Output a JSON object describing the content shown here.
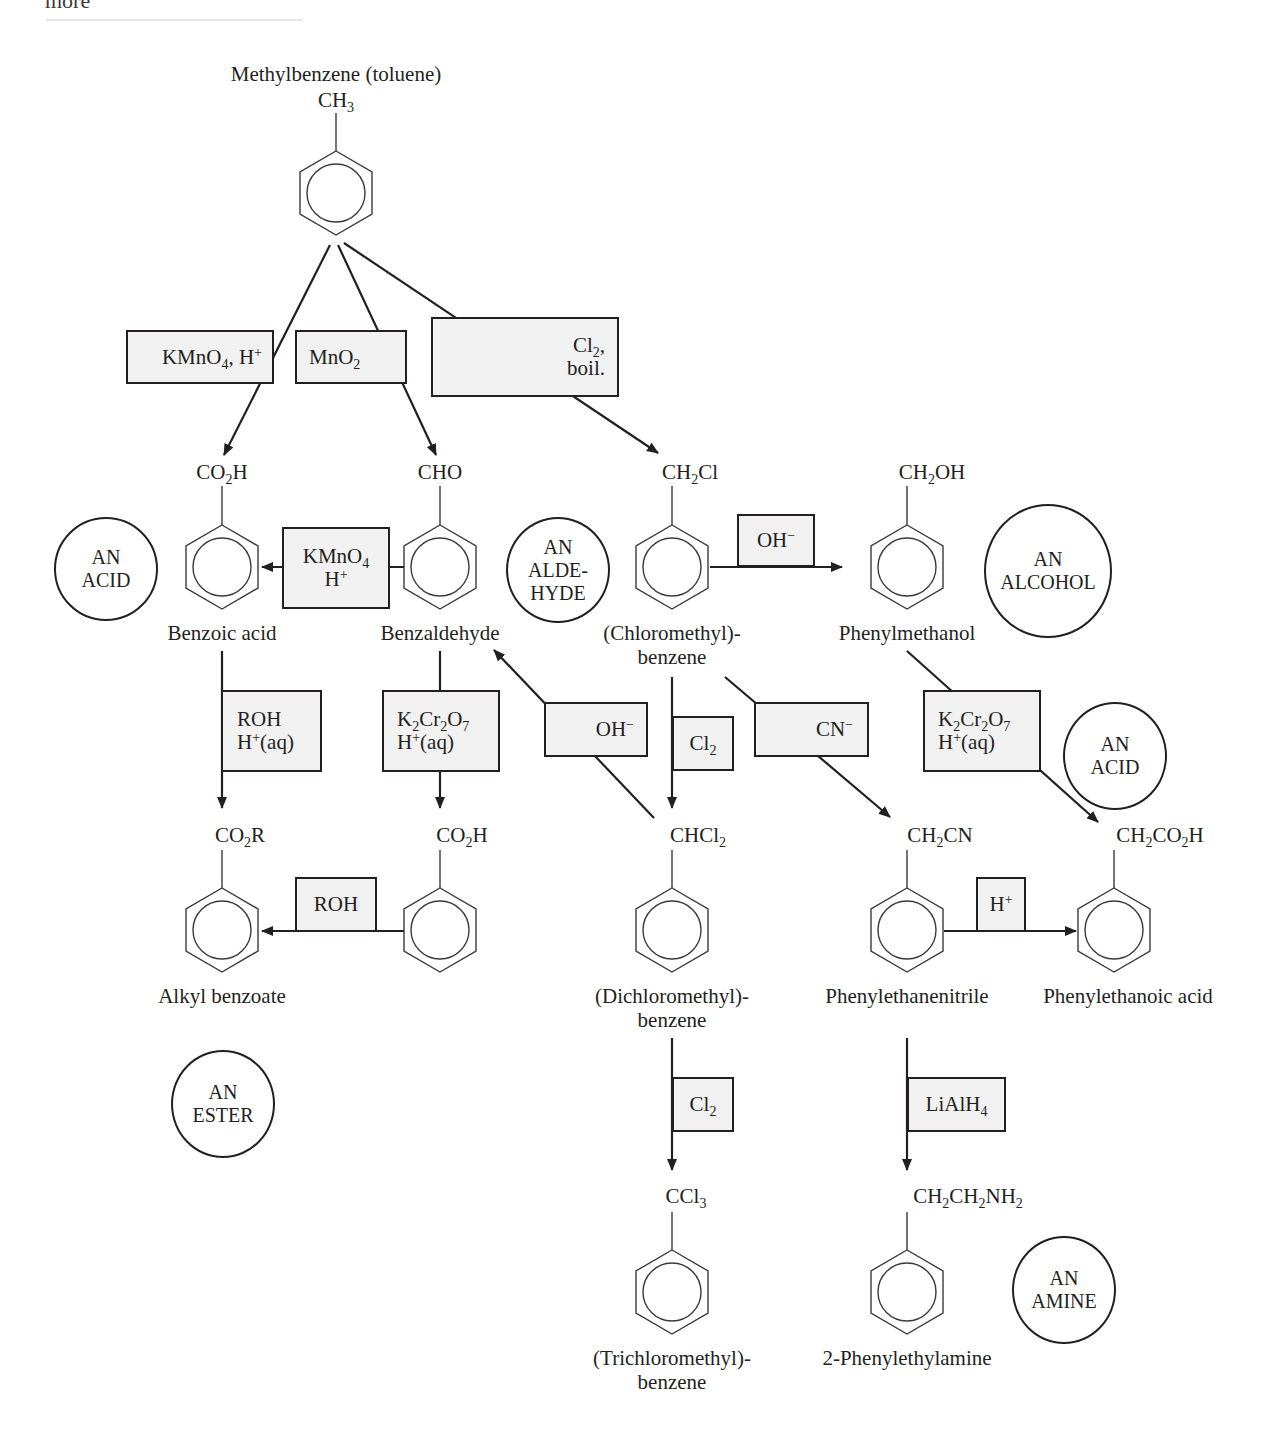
{
  "header": {
    "cut_word": "more"
  },
  "start": {
    "name": "Methylbenzene (toluene)",
    "group_html": "CH<sub>3</sub>"
  },
  "compounds": [
    {
      "id": "benzoic-acid",
      "group_html": "CO<sub>2</sub>H",
      "name": "Benzoic acid"
    },
    {
      "id": "benzaldehyde",
      "group_html": "CHO",
      "name": "Benzaldehyde"
    },
    {
      "id": "chloromethylbenzene",
      "group_html": "CH<sub>2</sub>Cl",
      "name_line1": "(Chloromethyl)-",
      "name_line2": "benzene"
    },
    {
      "id": "phenylmethanol",
      "group_html": "CH<sub>2</sub>OH",
      "name": "Phenylmethanol"
    },
    {
      "id": "alkyl-benzoate",
      "group_html": "CO<sub>2</sub>R",
      "name": "Alkyl benzoate"
    },
    {
      "id": "benzoic-acid-2",
      "group_html": "CO<sub>2</sub>H",
      "name": ""
    },
    {
      "id": "dichloromethylbenzene",
      "group_html": "CHCl<sub>2</sub>",
      "name_line1": "(Dichloromethyl)-",
      "name_line2": "benzene"
    },
    {
      "id": "phenylethanenitrile",
      "group_html": "CH<sub>2</sub>CN",
      "name": "Phenylethanenitrile"
    },
    {
      "id": "phenylethanoic-acid",
      "group_html": "CH<sub>2</sub>CO<sub>2</sub>H",
      "name": "Phenylethanoic acid"
    },
    {
      "id": "trichloromethylbenzene",
      "group_html": "CCl<sub>3</sub>",
      "name_line1": "(Trichloromethyl)-",
      "name_line2": "benzene"
    },
    {
      "id": "phenylethylamine",
      "group_html": "CH<sub>2</sub>CH<sub>2</sub>NH<sub>2</sub>",
      "name": "2-Phenylethylamine"
    }
  ],
  "reagents": {
    "kmno4_top": "KMnO<sub>4</sub>, H<sup>+</sup>",
    "mno2": "MnO<sub>2</sub>",
    "cl2_boil_1": "Cl<sub>2</sub>,",
    "cl2_boil_2": "boil.",
    "kmno4_mid_1": "KMnO<sub>4</sub>",
    "kmno4_mid_2": "H<sup>+</sup>",
    "oh_1": "OH<sup>&minus;</sup>",
    "roh_h_1": "ROH",
    "roh_h_2": "H<sup>+</sup>(aq)",
    "k2cr2o7_a_1": "K<sub>2</sub>Cr<sub>2</sub>O<sub>7</sub>",
    "k2cr2o7_a_2": "H<sup>+</sup>(aq)",
    "oh_2": "OH<sup>&minus;</sup>",
    "cl2_a": "Cl<sub>2</sub>",
    "cn": "CN<sup>&minus;</sup>",
    "k2cr2o7_b_1": "K<sub>2</sub>Cr<sub>2</sub>O<sub>7</sub>",
    "k2cr2o7_b_2": "H<sup>+</sup>(aq)",
    "roh": "ROH",
    "h_plus": "H<sup>+</sup>",
    "cl2_b": "Cl<sub>2</sub>",
    "lialh4": "LiAlH<sub>4</sub>"
  },
  "classes": {
    "acid_1": [
      "AN",
      "ACID"
    ],
    "aldehyde": [
      "AN",
      "ALDE-",
      "HYDE"
    ],
    "alcohol": [
      "AN",
      "ALCOHOL"
    ],
    "acid_2": [
      "AN",
      "ACID"
    ],
    "ester": [
      "AN",
      "ESTER"
    ],
    "amine": [
      "AN",
      "AMINE"
    ]
  },
  "colors": {
    "ink": "#231f20",
    "box_fill": "#f1f1f1",
    "background": "#ffffff"
  }
}
